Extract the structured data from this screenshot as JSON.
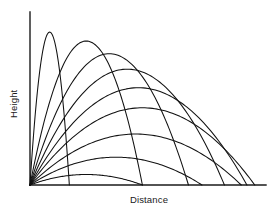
{
  "figure": {
    "background_color": "#ffffff",
    "line_color": "#111111",
    "axis_color": "#1a1a1a"
  },
  "axes": {
    "x_label": "Distance",
    "y_label": "Height",
    "origin_px": [
      30,
      185
    ],
    "x_axis_end_px": [
      266,
      185
    ],
    "y_axis_top_px": [
      30,
      12
    ],
    "ticks": [],
    "gridlines": false
  },
  "chart_data": {
    "type": "line",
    "title": "",
    "subtitle": "",
    "xlabel": "Distance",
    "ylabel": "Height",
    "xlim": [
      0,
      1.05
    ],
    "ylim": [
      0,
      0.56
    ],
    "grid": false,
    "legend": null,
    "legend_position": "none",
    "annotations": [],
    "common_origin": [
      0,
      0
    ],
    "series": [
      {
        "name": "85 deg",
        "launch_angle_deg": 85,
        "range": 0.175,
        "peak_height": 0.495,
        "apex": [
          0.0875,
          0.495
        ]
      },
      {
        "name": "75 deg",
        "launch_angle_deg": 75,
        "range": 0.5,
        "peak_height": 0.466,
        "apex": [
          0.25,
          0.466
        ]
      },
      {
        "name": "67.5 deg",
        "launch_angle_deg": 67.5,
        "range": 0.705,
        "peak_height": 0.425,
        "apex": [
          0.3525,
          0.425
        ]
      },
      {
        "name": "60 deg",
        "launch_angle_deg": 60,
        "range": 0.865,
        "peak_height": 0.375,
        "apex": [
          0.4325,
          0.375
        ]
      },
      {
        "name": "52.5 deg",
        "launch_angle_deg": 52.5,
        "range": 0.965,
        "peak_height": 0.315,
        "apex": [
          0.4825,
          0.315
        ]
      },
      {
        "name": "45 deg",
        "launch_angle_deg": 45,
        "range": 1.0,
        "peak_height": 0.25,
        "apex": [
          0.5,
          0.25
        ]
      },
      {
        "name": "35 deg",
        "launch_angle_deg": 35,
        "range": 0.94,
        "peak_height": 0.165,
        "apex": [
          0.47,
          0.165
        ]
      },
      {
        "name": "25 deg",
        "launch_angle_deg": 25,
        "range": 0.765,
        "peak_height": 0.09,
        "apex": [
          0.3825,
          0.09
        ]
      },
      {
        "name": "15 deg",
        "launch_angle_deg": 15,
        "range": 0.5,
        "peak_height": 0.034,
        "apex": [
          0.25,
          0.034
        ]
      }
    ]
  }
}
